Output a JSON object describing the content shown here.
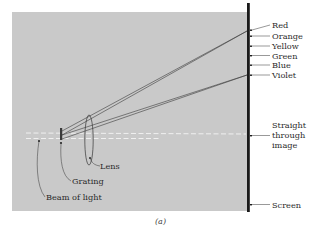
{
  "figure": {
    "caption": "(a)",
    "colors": {
      "background": "#ffffff",
      "panel": "#c9c9c9",
      "screen": "#1a1a1a",
      "ray": "#3a3a3a",
      "beam": "#f2f2f2",
      "label_text": "#2a2a2a"
    }
  },
  "screen_labels": [
    {
      "id": "red",
      "text": "Red"
    },
    {
      "id": "orange",
      "text": "Orange"
    },
    {
      "id": "yellow",
      "text": "Yellow"
    },
    {
      "id": "green",
      "text": "Green"
    },
    {
      "id": "blue",
      "text": "Blue"
    },
    {
      "id": "violet",
      "text": "Violet"
    }
  ],
  "straight_through": {
    "lines": [
      "Straight",
      "through",
      "image"
    ]
  },
  "screen_label": "Screen",
  "lens_label": "Lens",
  "grating_label": "Grating",
  "beam_label": "Beam of light"
}
